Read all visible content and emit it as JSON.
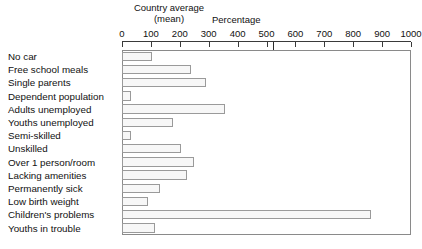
{
  "annotations": {
    "country_average_line1": "Country average",
    "country_average_line2": "(mean)",
    "axis_title": "Percentage"
  },
  "chart_data": {
    "type": "bar",
    "orientation": "horizontal",
    "title": "",
    "subtitle": "",
    "xlabel": "Percentage",
    "ylabel": "",
    "xlim": [
      0,
      1000
    ],
    "grid": false,
    "legend": null,
    "annotations": [
      {
        "text": "Country average (mean)",
        "x": 100,
        "note": "reference marker at the 100 tick"
      }
    ],
    "tick_labels": [
      "0",
      "100",
      "200",
      "300",
      "400",
      "500",
      "600",
      "700",
      "800",
      "900",
      "1000"
    ],
    "tick_values": [
      0,
      100,
      200,
      300,
      400,
      500,
      600,
      700,
      800,
      900,
      1000
    ],
    "categories": [
      "No car",
      "Free school meals",
      "Single parents",
      "Dependent population",
      "Adults unemployed",
      "Youths unemployed",
      "Semi-skilled",
      "Unskilled",
      "Over 1 person/room",
      "Lacking amenities",
      "Permanently sick",
      "Low birth weight",
      "Children's problems",
      "Youths in trouble"
    ],
    "values": [
      105,
      240,
      290,
      30,
      355,
      175,
      30,
      205,
      250,
      225,
      130,
      90,
      860,
      115
    ],
    "bar_fill": "#f7f7f7",
    "bar_edge": "#9a9a9a",
    "frame_color": "#8a8a8a",
    "axis_color": "#3a3a3a",
    "text_color": "#111111",
    "background": "#ffffff"
  }
}
